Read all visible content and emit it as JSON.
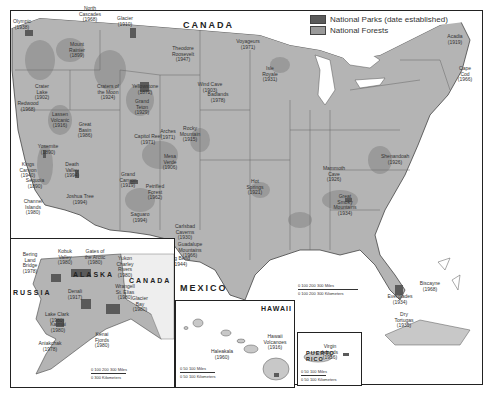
{
  "map": {
    "countries": {
      "canada": "CANADA",
      "mexico": "MEXICO",
      "russia": "RUSSIA",
      "canada_inset": "CANADA",
      "alaska": "ALASKA",
      "hawaii": "HAWAII",
      "puerto_rico": "PUERTO\nRICO"
    },
    "legend": [
      {
        "label": "National Parks (date established)",
        "color": "#5a5a5a"
      },
      {
        "label": "National Forests",
        "color": "#9a9a9a"
      }
    ],
    "colors": {
      "land": "#b4b4b4",
      "forest": "#9a9a9a",
      "park": "#5a5a5a",
      "water": "#ffffff",
      "border": "#555555"
    },
    "parks_main": [
      {
        "name": "Olympic\n(1938)",
        "x": 22,
        "y": 25
      },
      {
        "name": "North\nCascades\n(1968)",
        "x": 90,
        "y": 12
      },
      {
        "name": "Glacier\n(1910)",
        "x": 125,
        "y": 22
      },
      {
        "name": "Mount\nRainier\n(1899)",
        "x": 77,
        "y": 48
      },
      {
        "name": "Crater\nLake\n(1902)",
        "x": 42,
        "y": 90
      },
      {
        "name": "Redwood\n(1968)",
        "x": 28,
        "y": 107
      },
      {
        "name": "Lassen\nVolcanic\n(1916)",
        "x": 60,
        "y": 118
      },
      {
        "name": "Yosemite\n(1890)",
        "x": 48,
        "y": 150
      },
      {
        "name": "Kings\nCanyon\n(1940)",
        "x": 28,
        "y": 168
      },
      {
        "name": "Sequoia\n(1890)",
        "x": 35,
        "y": 184
      },
      {
        "name": "Channel\nIslands\n(1980)",
        "x": 33,
        "y": 205
      },
      {
        "name": "Great\nBasin\n(1986)",
        "x": 85,
        "y": 128
      },
      {
        "name": "Death\nValley\n(1994)",
        "x": 72,
        "y": 168
      },
      {
        "name": "Joshua Tree\n(1994)",
        "x": 80,
        "y": 200
      },
      {
        "name": "Yellowstone\n(1872)",
        "x": 145,
        "y": 90
      },
      {
        "name": "Grand\nTeton\n(1929)",
        "x": 142,
        "y": 105
      },
      {
        "name": "Craters of\nthe Moon\n(1924)",
        "x": 108,
        "y": 90
      },
      {
        "name": "Theodore\nRoosevelt\n(1947)",
        "x": 183,
        "y": 52
      },
      {
        "name": "Wind Cave\n(1903)",
        "x": 210,
        "y": 88
      },
      {
        "name": "Badlands\n(1978)",
        "x": 218,
        "y": 98
      },
      {
        "name": "Voyageurs\n(1971)",
        "x": 248,
        "y": 45
      },
      {
        "name": "Isle\nRoyale\n(1931)",
        "x": 270,
        "y": 72
      },
      {
        "name": "Capitol Reef\n(1971)",
        "x": 148,
        "y": 140
      },
      {
        "name": "Arches\n(1971)",
        "x": 168,
        "y": 135
      },
      {
        "name": "Rocky\nMountain\n(1915)",
        "x": 190,
        "y": 132
      },
      {
        "name": "Mesa\nVerde\n(1906)",
        "x": 170,
        "y": 160
      },
      {
        "name": "Grand\nCanyon\n(1919)",
        "x": 128,
        "y": 178
      },
      {
        "name": "Petrified\nForest\n(1962)",
        "x": 155,
        "y": 190
      },
      {
        "name": "Saguaro\n(1994)",
        "x": 140,
        "y": 218
      },
      {
        "name": "Carlsbad\nCaverns\n(1930)",
        "x": 185,
        "y": 230
      },
      {
        "name": "Guadalupe\nMountains\n(1966)",
        "x": 190,
        "y": 248
      },
      {
        "name": "Big Bend\n(1944)",
        "x": 180,
        "y": 262
      },
      {
        "name": "Hot\nSprings\n(1921)",
        "x": 255,
        "y": 185
      },
      {
        "name": "Mammoth\nCave\n(1926)",
        "x": 334,
        "y": 172
      },
      {
        "name": "Great\nSmoky\nMountains\n(1934)",
        "x": 345,
        "y": 200
      },
      {
        "name": "Shenandoah\n(1926)",
        "x": 395,
        "y": 160
      },
      {
        "name": "Acadia\n(1919)",
        "x": 455,
        "y": 40
      },
      {
        "name": "Cape\nCod\n(1966)",
        "x": 465,
        "y": 72
      },
      {
        "name": "Everglades\n(1934)",
        "x": 400,
        "y": 300
      },
      {
        "name": "Biscayne\n(1968)",
        "x": 430,
        "y": 287
      },
      {
        "name": "Dry\nTortugas\n(1935)",
        "x": 404,
        "y": 318
      }
    ],
    "parks_alaska": [
      {
        "name": "Bering\nLand\nBridge\n(1978)",
        "x": 30,
        "y": 258
      },
      {
        "name": "Kobuk\nValley\n(1980)",
        "x": 65,
        "y": 255
      },
      {
        "name": "Gates of\nthe Arctic\n(1980)",
        "x": 95,
        "y": 255
      },
      {
        "name": "Yukon\nCharley\nRivers\n(1980)",
        "x": 125,
        "y": 262
      },
      {
        "name": "Denali\n(1917)",
        "x": 75,
        "y": 295
      },
      {
        "name": "Wrangell\nSt. Elias\n(1980)",
        "x": 125,
        "y": 290
      },
      {
        "name": "Glacier\nBay\n(1980)",
        "x": 140,
        "y": 302
      },
      {
        "name": "Lake Clark\n(1980)",
        "x": 57,
        "y": 318
      },
      {
        "name": "Katmai\n(1980)",
        "x": 58,
        "y": 328
      },
      {
        "name": "Kenai\nFjords\n(1980)",
        "x": 102,
        "y": 338
      },
      {
        "name": "Aniakchak\n(1978)",
        "x": 50,
        "y": 347
      }
    ],
    "parks_hawaii": [
      {
        "name": "Haleakala\n(1960)",
        "x": 222,
        "y": 355
      },
      {
        "name": "Hawaii\nVolcanoes\n(1916)",
        "x": 275,
        "y": 340
      }
    ],
    "parks_pr": [
      {
        "name": "Virgin Islands\n(1956)",
        "x": 330,
        "y": 350
      }
    ],
    "scales": {
      "main_miles": "0   100   200   300 Miles",
      "main_km": "0  100 200  300 Kilometers",
      "alaska_miles": "0  100  200  300 Miles",
      "alaska_km": "0     300 Kilometers",
      "hawaii_miles": "0   50   100 Miles",
      "hawaii_km": "0  50  100 Kilometers",
      "pr_miles": "0   50   100 Miles",
      "pr_km": "0  50  100 Kilometers"
    }
  }
}
